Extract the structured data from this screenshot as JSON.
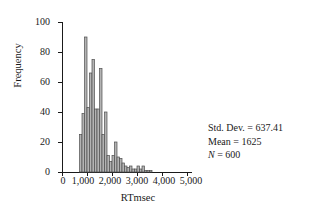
{
  "chart_data": {
    "type": "bar",
    "title": "",
    "subtitle": "",
    "xlabel": "RTmsec",
    "ylabel": "Frequency",
    "xlim": [
      0,
      5200
    ],
    "ylim": [
      0,
      100
    ],
    "grid": false,
    "legend": null,
    "bin_width": 100,
    "xticks": [
      0,
      1000,
      2000,
      3000,
      4000,
      5000
    ],
    "xtick_labels": [
      "0",
      "1,000",
      "2,000",
      "3,000",
      "4,000",
      "5,000"
    ],
    "yticks": [
      0,
      20,
      40,
      60,
      80,
      100
    ],
    "ytick_labels": [
      "0",
      "20",
      "40",
      "60",
      "80",
      "100"
    ],
    "bar_fill": "#b3b3b3",
    "bar_stroke": "#4d4d4d",
    "axis_color": "#1a1a1a",
    "bin_starts": [
      700,
      800,
      900,
      1000,
      1100,
      1200,
      1300,
      1400,
      1500,
      1600,
      1700,
      1800,
      1900,
      2000,
      2100,
      2200,
      2300,
      2400,
      2500,
      2600,
      2700,
      2800,
      2900,
      3000,
      3100,
      3200,
      3300,
      3400,
      3500,
      3600,
      3700,
      3800,
      3900,
      4000,
      4100,
      4200,
      4300,
      4400,
      4500,
      4600,
      4700
    ],
    "values": [
      25,
      39,
      90,
      43,
      66,
      75,
      42,
      42,
      69,
      25,
      40,
      11,
      7,
      11,
      20,
      10,
      9,
      6,
      4,
      3,
      4,
      2,
      2,
      4,
      2,
      4,
      1,
      1,
      1,
      0,
      0,
      0,
      0,
      0,
      0,
      0,
      0,
      0,
      0,
      0,
      0
    ]
  },
  "annotations": {
    "std_dev": "Std. Dev. = 637.41",
    "mean": "Mean = 1625",
    "n_symbol": "N",
    "n_value": " = 600"
  }
}
